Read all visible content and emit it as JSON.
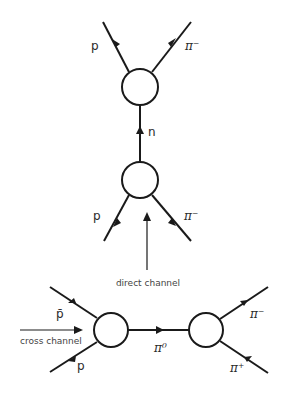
{
  "diagram": {
    "direct_channel": {
      "caption": "direct channel",
      "outgoing": [
        {
          "particle": "p"
        },
        {
          "particle": "π⁻"
        }
      ],
      "intermediate": {
        "particle": "n"
      },
      "incoming": [
        {
          "particle": "p"
        },
        {
          "particle": "π⁻"
        }
      ]
    },
    "cross_channel": {
      "caption": "cross channel",
      "incoming": [
        {
          "particle": "p̄"
        },
        {
          "particle": "p"
        }
      ],
      "intermediate": {
        "particle": "π⁰"
      },
      "outgoing": [
        {
          "particle": "π⁻"
        },
        {
          "particle": "π⁺"
        }
      ]
    }
  }
}
